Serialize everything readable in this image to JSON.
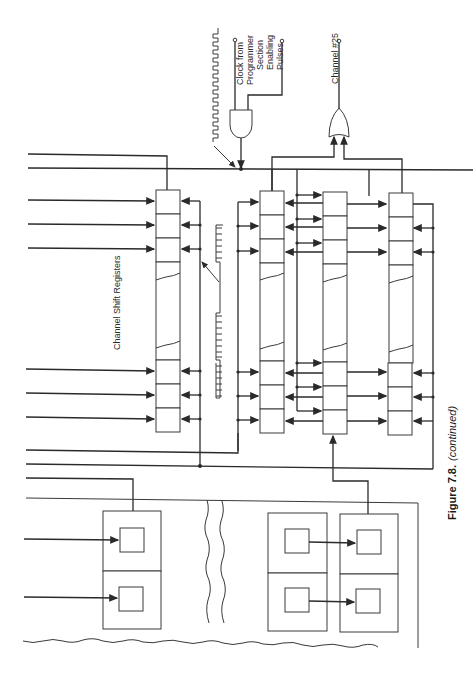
{
  "figure": {
    "caption_bold": "Figure 7.8.",
    "caption_italic": "(continued)"
  },
  "labels": {
    "clock": [
      "Clock from",
      "Programmer"
    ],
    "section": [
      "Section",
      "Enabling",
      "Pulses"
    ],
    "channel": "Channel #25",
    "registers": "Channel Shift Registers"
  },
  "components": {
    "and_gate": "AND gate combining clock and section enabling pulses",
    "or_gate": "OR gate producing Channel #25 output",
    "register_columns": 4,
    "cells_top_per_column": 3,
    "cells_bottom_per_column": 3,
    "memory_panels_left": 1,
    "memory_panels_right": 2
  },
  "colors": {
    "ink": "#2a2a2a",
    "paper": "#ffffff"
  }
}
